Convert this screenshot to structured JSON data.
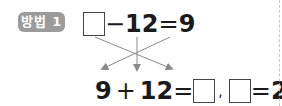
{
  "badge": {
    "label": "방법 1",
    "color": "#9b9b9b"
  },
  "top_equation": {
    "blank": "",
    "operator": "−",
    "operand": "12",
    "equals": "=",
    "result": "9"
  },
  "arrows": {
    "color": "#8a8a8a",
    "icon": "cross-arrows-icon",
    "count": 3
  },
  "bottom_equation": {
    "left": "9",
    "operator": "+",
    "operand": "12",
    "equals": "=",
    "blank1": "",
    "separator": ",",
    "blank2": "",
    "equals2": "=",
    "answer": "21"
  },
  "divider": {
    "style": "dashed",
    "color": "#c8c8c8"
  }
}
